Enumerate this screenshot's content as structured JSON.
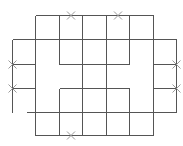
{
  "diagram": {
    "title": "",
    "line_color": "#555555",
    "marker_color": "#9a9a9a",
    "grid": {
      "columns": 7,
      "rows": 5
    },
    "segments": [
      {
        "id": "top",
        "from": [
          1,
          0
        ],
        "to": [
          6,
          0
        ]
      },
      {
        "id": "row1",
        "from": [
          0,
          1
        ],
        "to": [
          7,
          1
        ]
      },
      {
        "id": "row2-left",
        "from": [
          0,
          2
        ],
        "to": [
          1,
          2
        ]
      },
      {
        "id": "row2-inner",
        "from": [
          2,
          2
        ],
        "to": [
          5,
          2
        ]
      },
      {
        "id": "row2-right",
        "from": [
          6,
          2
        ],
        "to": [
          7,
          2
        ]
      },
      {
        "id": "row3-left",
        "from": [
          0,
          3
        ],
        "to": [
          1,
          3
        ]
      },
      {
        "id": "row3-inner",
        "from": [
          2,
          3
        ],
        "to": [
          5,
          3
        ]
      },
      {
        "id": "row3-right",
        "from": [
          6,
          3
        ],
        "to": [
          7,
          3
        ]
      },
      {
        "id": "row4",
        "from": [
          0.65,
          4
        ],
        "to": [
          7,
          4
        ]
      },
      {
        "id": "bottom",
        "from": [
          1,
          5
        ],
        "to": [
          6,
          5
        ]
      },
      {
        "id": "col0",
        "from": [
          0,
          1
        ],
        "to": [
          0,
          4
        ]
      },
      {
        "id": "col1",
        "from": [
          1,
          0
        ],
        "to": [
          1,
          5
        ]
      },
      {
        "id": "col2-top",
        "from": [
          2,
          0
        ],
        "to": [
          2,
          2
        ]
      },
      {
        "id": "col2-bottom",
        "from": [
          2,
          3
        ],
        "to": [
          2,
          5
        ]
      },
      {
        "id": "col3",
        "from": [
          3,
          0
        ],
        "to": [
          3,
          5
        ]
      },
      {
        "id": "col4",
        "from": [
          4,
          0
        ],
        "to": [
          4,
          5
        ]
      },
      {
        "id": "col5-top",
        "from": [
          5,
          0
        ],
        "to": [
          5,
          2
        ]
      },
      {
        "id": "col5-bottom",
        "from": [
          5,
          3
        ],
        "to": [
          5,
          5
        ]
      },
      {
        "id": "col6",
        "from": [
          6,
          0
        ],
        "to": [
          6,
          5
        ]
      },
      {
        "id": "col7",
        "from": [
          7,
          1
        ],
        "to": [
          7,
          4
        ]
      }
    ],
    "markers": [
      {
        "id": "x-top-1",
        "at": [
          2.5,
          0
        ]
      },
      {
        "id": "x-top-2",
        "at": [
          4.5,
          0
        ]
      },
      {
        "id": "x-left-1",
        "at": [
          0,
          2
        ]
      },
      {
        "id": "x-left-2",
        "at": [
          0,
          3
        ]
      },
      {
        "id": "x-right-1",
        "at": [
          7,
          2
        ]
      },
      {
        "id": "x-right-2",
        "at": [
          7,
          3
        ]
      },
      {
        "id": "x-bottom-1",
        "at": [
          2.5,
          5
        ]
      }
    ]
  }
}
